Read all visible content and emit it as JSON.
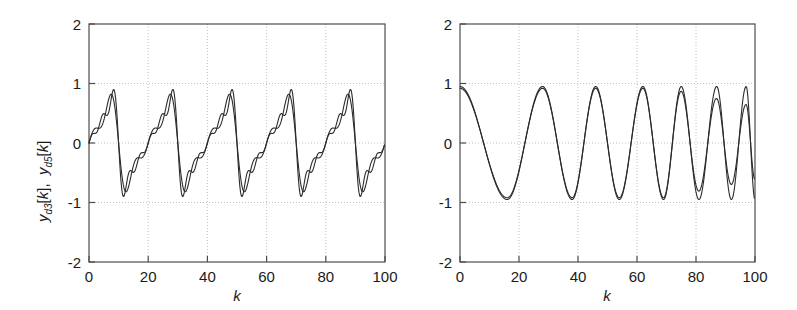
{
  "figure": {
    "background": "#ffffff",
    "axis_color": "#4d4d4d",
    "grid_color": "#b3b3b3",
    "curve_color": "#2b2b2b",
    "panel_count": 2
  },
  "chart_data": [
    {
      "type": "line",
      "id": "left-panel",
      "title": "",
      "xlabel": "k",
      "ylabel": "y_{d3}[k], y_{d5}[k]",
      "ylabel_parts": {
        "series1": {
          "base": "y",
          "sub": "d3",
          "index": "[k]"
        },
        "series2": {
          "base": "y",
          "sub": "d5",
          "index": "[k]"
        }
      },
      "xlim": [
        0,
        100
      ],
      "ylim": [
        -2,
        2
      ],
      "xticks": [
        0,
        20,
        40,
        60,
        80,
        100
      ],
      "yticks": [
        2,
        1,
        0,
        -1,
        -2
      ],
      "xtick_labels": [
        "0",
        "20",
        "40",
        "60",
        "80",
        "100"
      ],
      "ytick_labels": [
        "2",
        "1",
        "0",
        "-1",
        "-2"
      ],
      "grid": true,
      "grid_style": "dotted",
      "legend": "none",
      "waveform": "sawtooth",
      "period": 20,
      "peak_value": 0.9,
      "trough_value": -0.9,
      "series": [
        {
          "name": "y_d3[k]",
          "harmonics": 3,
          "peak": 0.82,
          "x": [
            0,
            2,
            4,
            6,
            8,
            10,
            12,
            14,
            16,
            18,
            20,
            22,
            24,
            26,
            28,
            30,
            32,
            34,
            36,
            38,
            40,
            42,
            44,
            46,
            48,
            50,
            52,
            54,
            56,
            58,
            60,
            62,
            64,
            66,
            68,
            70,
            72,
            74,
            76,
            78,
            80,
            82,
            84,
            86,
            88,
            90,
            92,
            94,
            96,
            98,
            100
          ],
          "values": [
            0.0,
            0.78,
            0.82,
            0.66,
            0.49,
            0.33,
            0.16,
            0.0,
            -0.16,
            -0.33,
            -0.49,
            0.78,
            0.82,
            0.66,
            0.49,
            0.33,
            0.16,
            0.0,
            -0.16,
            -0.33,
            -0.49,
            0.78,
            0.82,
            0.66,
            0.49,
            0.33,
            0.16,
            0.0,
            -0.16,
            -0.33,
            -0.49,
            0.78,
            0.82,
            0.66,
            0.49,
            0.33,
            0.16,
            0.0,
            -0.16,
            -0.33,
            -0.49,
            0.78,
            0.82,
            0.66,
            0.49,
            0.33,
            0.16,
            0.0,
            -0.16,
            -0.33,
            -0.49
          ]
        },
        {
          "name": "y_d5[k]",
          "harmonics": 5,
          "peak": 0.9,
          "x": [
            0,
            2,
            4,
            6,
            8,
            10,
            12,
            14,
            16,
            18,
            20,
            22,
            24,
            26,
            28,
            30,
            32,
            34,
            36,
            38,
            40,
            42,
            44,
            46,
            48,
            50,
            52,
            54,
            56,
            58,
            60,
            62,
            64,
            66,
            68,
            70,
            72,
            74,
            76,
            78,
            80,
            82,
            84,
            86,
            88,
            90,
            92,
            94,
            96,
            98,
            100
          ],
          "values": [
            0.0,
            0.86,
            0.9,
            0.7,
            0.52,
            0.35,
            0.17,
            0.0,
            -0.17,
            -0.35,
            -0.52,
            0.86,
            0.9,
            0.7,
            0.52,
            0.35,
            0.17,
            0.0,
            -0.17,
            -0.35,
            -0.52,
            0.86,
            0.9,
            0.7,
            0.52,
            0.35,
            0.17,
            0.0,
            -0.17,
            -0.35,
            -0.52,
            0.86,
            0.9,
            0.7,
            0.52,
            0.35,
            0.17,
            0.0,
            -0.17,
            -0.35,
            -0.52,
            0.86,
            0.9,
            0.7,
            0.52,
            0.35,
            0.17,
            0.0,
            -0.17,
            -0.35,
            -0.52
          ]
        }
      ],
      "description": "Five periods of a band-limited sawtooth wave rising sharply from about -0.9 to +0.9 then decaying linearly; period 20 samples; two nearly overlapping traces differing only in peak overshoot."
    },
    {
      "type": "line",
      "id": "right-panel",
      "title": "",
      "xlabel": "k",
      "ylabel": "y_{c3}[k], y_{c5}[k]",
      "ylabel_parts": {
        "series1": {
          "base": "y",
          "sub": "c3",
          "index": "[k]"
        },
        "series2": {
          "base": "y",
          "sub": "c5",
          "index": "[k]"
        }
      },
      "xlim": [
        0,
        100
      ],
      "ylim": [
        -2,
        2
      ],
      "xticks": [
        0,
        20,
        40,
        60,
        80,
        100
      ],
      "yticks": [
        2,
        1,
        0,
        -1,
        -2
      ],
      "xtick_labels": [
        "0",
        "20",
        "40",
        "60",
        "80",
        "100"
      ],
      "ytick_labels": [
        "2",
        "1",
        "0",
        "-1",
        "-2"
      ],
      "grid": true,
      "grid_style": "dotted",
      "legend": "none",
      "waveform": "chirp",
      "peak_value": 0.95,
      "trough_value": -0.95,
      "extrema": {
        "peaks_at": [
          0,
          28,
          46,
          62,
          75,
          87,
          97
        ],
        "troughs_at": [
          16,
          38,
          54,
          69,
          81,
          92,
          100
        ]
      },
      "series": [
        {
          "name": "y_c3[k]",
          "harmonics": 3,
          "amplitude": 0.92,
          "note": "slightly lower amplitude at late high-frequency cycles"
        },
        {
          "name": "y_c5[k]",
          "harmonics": 5,
          "amplitude": 0.95,
          "note": "tracks full amplitude through the final cycle"
        }
      ],
      "description": "A chirp whose instantaneous frequency increases with k: starts near +1 at k=0, first minimum near k=16, maxima near k=28, 46, 62, 75, 87 and 97; the two traces separate visibly after k≈75 where one trace shows reduced amplitude."
    }
  ]
}
